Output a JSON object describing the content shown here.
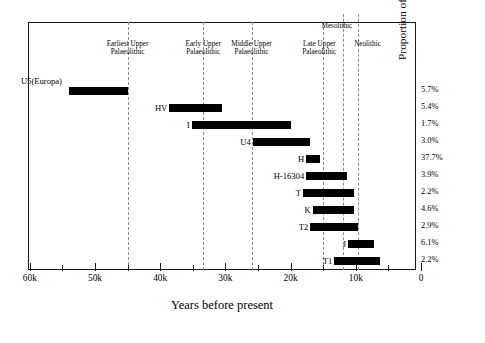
{
  "chart_data": {
    "type": "bar",
    "orientation": "horizontal-range",
    "title": "",
    "xlabel": "Years before present",
    "ylabel": "Proportion of European lineages today",
    "xlim": [
      60,
      0
    ],
    "x_tick_labels": [
      "60k",
      "50k",
      "40k",
      "30k",
      "20k",
      "10k",
      "0"
    ],
    "x_tick_values": [
      60,
      50,
      40,
      30,
      20,
      10,
      0
    ],
    "x_minor_tick_values": [
      55,
      45,
      35,
      25,
      15,
      5
    ],
    "grid": false,
    "legend": "none",
    "categories": [
      "U5(Europa)",
      "HV",
      "I",
      "U4",
      "H",
      "H-16304",
      "T",
      "K",
      "T2",
      "J",
      "T1"
    ],
    "value_label_header": "Proportion of European lineages today",
    "bars": [
      {
        "label": "U5(Europa)",
        "start_k": 54.0,
        "end_k": 45.0,
        "percent": "5.7%",
        "label_placement": "above-left"
      },
      {
        "label": "HV",
        "start_k": 38.6,
        "end_k": 30.5,
        "percent": "5.4%",
        "label_placement": "left"
      },
      {
        "label": "I",
        "start_k": 35.2,
        "end_k": 19.9,
        "percent": "1.7%",
        "label_placement": "left"
      },
      {
        "label": "U4",
        "start_k": 25.8,
        "end_k": 17.0,
        "percent": "3.0%",
        "label_placement": "left"
      },
      {
        "label": "H",
        "start_k": 17.6,
        "end_k": 15.5,
        "percent": "37.7%",
        "label_placement": "left"
      },
      {
        "label": "H-16304",
        "start_k": 17.6,
        "end_k": 11.3,
        "percent": "3.9%",
        "label_placement": "left"
      },
      {
        "label": "T",
        "start_k": 18.1,
        "end_k": 10.3,
        "percent": "2.2%",
        "label_placement": "left"
      },
      {
        "label": "K",
        "start_k": 16.6,
        "end_k": 10.3,
        "percent": "4.6%",
        "label_placement": "left"
      },
      {
        "label": "T2",
        "start_k": 17.0,
        "end_k": 9.7,
        "percent": "2.9%",
        "label_placement": "left"
      },
      {
        "label": "J",
        "start_k": 11.2,
        "end_k": 7.2,
        "percent": "6.1%",
        "label_placement": "left"
      },
      {
        "label": "T1",
        "start_k": 13.3,
        "end_k": 6.3,
        "percent": "2.2%",
        "label_placement": "left"
      }
    ],
    "era_markers": [
      {
        "name": "Earliest Upper Palaeolithic",
        "line1": "Earliest Upper",
        "line2": "Palaeolithic",
        "at_k": 45.0,
        "label_center_k": 45.0,
        "tall": false
      },
      {
        "name": "Early Upper Palaeolithic",
        "line1": "Early Upper",
        "line2": "Palaeolithic",
        "at_k": 33.4,
        "label_center_k": 33.4,
        "tall": false
      },
      {
        "name": "Middle Upper Palaeolithic",
        "line1": "Middle Upper",
        "line2": "Palaeolithic",
        "at_k": 26.0,
        "label_center_k": 26.0,
        "tall": false
      },
      {
        "name": "Late Upper Palaeolithic",
        "line1": "Late Upper",
        "line2": "Palaeolithic",
        "at_k": 15.0,
        "label_center_k": 15.6,
        "tall": false
      },
      {
        "name": "Mesolithic",
        "line1": "Mesolithic",
        "line2": "",
        "at_k": 12.0,
        "label_center_k": 12.9,
        "tall": true
      },
      {
        "name": "Neolithic",
        "line1": "Neolithic",
        "line2": "",
        "at_k": 9.6,
        "label_center_k": 8.2,
        "tall": true
      }
    ]
  },
  "axis": {
    "x_title": "Years before present",
    "y_title": "Proportion of European lineages today"
  },
  "ticks": {
    "labels": [
      "60k",
      "50k",
      "40k",
      "30k",
      "20k",
      "10k",
      "0"
    ]
  }
}
